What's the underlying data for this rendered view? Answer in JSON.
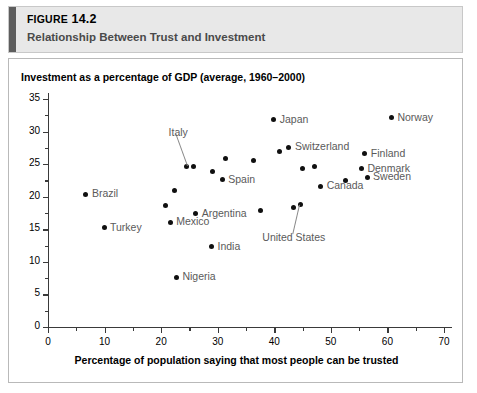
{
  "figure": {
    "label": "FIGURE",
    "number": "14.2",
    "subtitle": "Relationship Between Trust and Investment"
  },
  "chart_data": {
    "type": "scatter",
    "title": "Relationship Between Trust and Investment",
    "xlabel": "Percentage of population saying that most people can be trusted",
    "ylabel": "Investment as a percentage of GDP (average, 1960–2000)",
    "xlim": [
      0,
      70
    ],
    "ylim": [
      0,
      35
    ],
    "xticks": [
      0,
      10,
      20,
      30,
      40,
      50,
      60,
      70
    ],
    "yticks": [
      0,
      5,
      10,
      15,
      20,
      25,
      30,
      35
    ],
    "x_minor_step": 5,
    "y_minor_step": 2.5,
    "grid": false,
    "legend": false,
    "points": [
      {
        "label": "Brazil",
        "x": 6.7,
        "y": 20.4,
        "label_pos": "right"
      },
      {
        "label": "Turkey",
        "x": 9.9,
        "y": 15.2,
        "label_pos": "right"
      },
      {
        "label": "",
        "x": 20.8,
        "y": 18.6,
        "label_pos": "none"
      },
      {
        "label": "Mexico",
        "x": 21.6,
        "y": 16.1,
        "label_pos": "right"
      },
      {
        "label": "",
        "x": 22.4,
        "y": 20.9,
        "label_pos": "none"
      },
      {
        "label": "Nigeria",
        "x": 22.7,
        "y": 7.6,
        "label_pos": "right"
      },
      {
        "label": "Italy",
        "x": 24.5,
        "y": 24.7,
        "label_pos": "leader-up"
      },
      {
        "label": "",
        "x": 25.8,
        "y": 24.7,
        "label_pos": "none"
      },
      {
        "label": "Argentina",
        "x": 26.1,
        "y": 17.4,
        "label_pos": "right"
      },
      {
        "label": "India",
        "x": 28.9,
        "y": 12.3,
        "label_pos": "right"
      },
      {
        "label": "",
        "x": 29.1,
        "y": 23.9,
        "label_pos": "none"
      },
      {
        "label": "Spain",
        "x": 30.8,
        "y": 22.6,
        "label_pos": "right"
      },
      {
        "label": "",
        "x": 31.4,
        "y": 25.8,
        "label_pos": "none"
      },
      {
        "label": "",
        "x": 36.3,
        "y": 25.6,
        "label_pos": "none"
      },
      {
        "label": "",
        "x": 37.6,
        "y": 17.9,
        "label_pos": "none"
      },
      {
        "label": "Japan",
        "x": 39.9,
        "y": 31.8,
        "label_pos": "right"
      },
      {
        "label": "",
        "x": 41.0,
        "y": 27.0,
        "label_pos": "none"
      },
      {
        "label": "Switzerland",
        "x": 42.6,
        "y": 27.6,
        "label_pos": "right"
      },
      {
        "label": "",
        "x": 43.4,
        "y": 18.3,
        "label_pos": "none"
      },
      {
        "label": "United States",
        "x": 44.6,
        "y": 18.8,
        "label_pos": "leader-down"
      },
      {
        "label": "",
        "x": 44.9,
        "y": 24.4,
        "label_pos": "none"
      },
      {
        "label": "",
        "x": 47.1,
        "y": 24.6,
        "label_pos": "none"
      },
      {
        "label": "Canada",
        "x": 48.2,
        "y": 21.6,
        "label_pos": "right"
      },
      {
        "label": "",
        "x": 52.6,
        "y": 22.5,
        "label_pos": "none"
      },
      {
        "label": "Finland",
        "x": 56.0,
        "y": 26.6,
        "label_pos": "right"
      },
      {
        "label": "Denmark",
        "x": 55.4,
        "y": 24.3,
        "label_pos": "right"
      },
      {
        "label": "Sweden",
        "x": 56.4,
        "y": 23.0,
        "label_pos": "right"
      },
      {
        "label": "Norway",
        "x": 60.7,
        "y": 32.1,
        "label_pos": "right"
      }
    ]
  },
  "colors": {
    "header_bg": "#e8e8e8",
    "header_accent": "#5d5d5d",
    "dot": "#101010",
    "point_label": "#5a5a5a",
    "axis": "#3a3a3a"
  }
}
